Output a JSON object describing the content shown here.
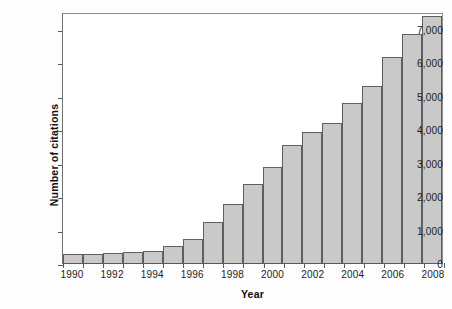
{
  "chart_data": {
    "type": "bar",
    "title": "",
    "xlabel": "Year",
    "ylabel": "Number of citations",
    "categories": [
      "1990",
      "1991",
      "1992",
      "1993",
      "1994",
      "1995",
      "1996",
      "1997",
      "1998",
      "1999",
      "2000",
      "2001",
      "2002",
      "2003",
      "2004",
      "2005",
      "2006",
      "2007",
      "2008"
    ],
    "values": [
      270,
      275,
      300,
      330,
      370,
      510,
      730,
      1240,
      1760,
      2350,
      2860,
      3540,
      3900,
      4170,
      4790,
      5300,
      6160,
      6830,
      7370
    ],
    "xtick_labels": [
      "1990",
      "1992",
      "1994",
      "1996",
      "1998",
      "2000",
      "2002",
      "2004",
      "2006",
      "2008"
    ],
    "ytick_labels": [
      "0",
      "1,000",
      "2,000",
      "3,000",
      "4,000",
      "5,000",
      "6,000",
      "7,000"
    ],
    "ytick_values": [
      0,
      1000,
      2000,
      3000,
      4000,
      5000,
      6000,
      7000
    ],
    "ylim": [
      0,
      7500
    ],
    "grid": false,
    "legend": null,
    "bar_color": "#c9c9c9",
    "bar_edge_color": "#5f5f5f",
    "axis_color": "#5a5a5a",
    "background_color": "#ffffff"
  }
}
